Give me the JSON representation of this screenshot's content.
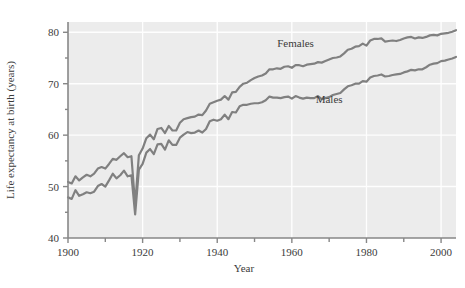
{
  "chart_data": {
    "type": "line",
    "title": "",
    "xlabel": "Year",
    "ylabel": "Life expectancy at birth (years)",
    "xlim": [
      1900,
      2004
    ],
    "ylim": [
      40,
      82
    ],
    "xticks": [
      1900,
      1920,
      1940,
      1960,
      1980,
      2000
    ],
    "xtick_labels": [
      "1900",
      "1920",
      "1940",
      "1960",
      "1980",
      "2000"
    ],
    "xminorticks": [
      1910,
      1930,
      1950,
      1970,
      1990
    ],
    "yticks": [
      40,
      50,
      60,
      70,
      80
    ],
    "ytick_labels": [
      "40",
      "50",
      "60",
      "70",
      "80"
    ],
    "yminorticks": [
      45,
      55,
      65,
      75
    ],
    "grid": true,
    "grid_color": "#ffffff",
    "plot_background": "#ececec",
    "line_color": "#808080",
    "legend_position": "inline-annotations",
    "annotations": [
      {
        "text": "Females",
        "x": 1961,
        "y": 77.2
      },
      {
        "text": "Males",
        "x": 1970,
        "y": 66.2
      }
    ],
    "series": [
      {
        "name": "Females",
        "label": "Females",
        "color": "#808080",
        "x": [
          1900,
          1901,
          1902,
          1903,
          1904,
          1905,
          1906,
          1907,
          1908,
          1909,
          1910,
          1911,
          1912,
          1913,
          1914,
          1915,
          1916,
          1917,
          1918,
          1919,
          1920,
          1921,
          1922,
          1923,
          1924,
          1925,
          1926,
          1927,
          1928,
          1929,
          1930,
          1931,
          1932,
          1933,
          1934,
          1935,
          1936,
          1937,
          1938,
          1939,
          1940,
          1941,
          1942,
          1943,
          1944,
          1945,
          1946,
          1947,
          1948,
          1949,
          1950,
          1951,
          1952,
          1953,
          1954,
          1955,
          1956,
          1957,
          1958,
          1959,
          1960,
          1961,
          1962,
          1963,
          1964,
          1965,
          1966,
          1967,
          1968,
          1969,
          1970,
          1971,
          1972,
          1973,
          1974,
          1975,
          1976,
          1977,
          1978,
          1979,
          1980,
          1981,
          1982,
          1983,
          1984,
          1985,
          1986,
          1987,
          1988,
          1989,
          1990,
          1991,
          1992,
          1993,
          1994,
          1995,
          1996,
          1997,
          1998,
          1999,
          2000,
          2001,
          2002,
          2003,
          2004
        ],
        "y": [
          50.9,
          50.6,
          52.0,
          51.2,
          51.8,
          52.3,
          52.0,
          52.5,
          53.5,
          53.8,
          53.5,
          54.4,
          55.4,
          55.2,
          55.9,
          56.5,
          55.7,
          55.9,
          46.4,
          56.1,
          57.4,
          59.4,
          60.1,
          59.2,
          61.2,
          61.4,
          60.4,
          61.8,
          60.9,
          60.9,
          62.4,
          63.1,
          63.3,
          63.5,
          63.6,
          64.0,
          63.9,
          64.8,
          66.1,
          66.4,
          66.7,
          66.9,
          67.6,
          66.9,
          68.3,
          68.4,
          69.4,
          70.0,
          70.2,
          70.7,
          71.1,
          71.4,
          71.6,
          72.0,
          72.8,
          72.8,
          73.0,
          72.9,
          73.3,
          73.4,
          73.1,
          73.6,
          73.6,
          73.4,
          73.7,
          73.8,
          73.9,
          74.2,
          74.1,
          74.4,
          74.7,
          75.0,
          75.1,
          75.3,
          75.9,
          76.6,
          76.8,
          77.2,
          77.3,
          77.8,
          77.4,
          78.4,
          78.7,
          78.7,
          78.8,
          78.2,
          78.3,
          78.4,
          78.3,
          78.5,
          78.8,
          79.0,
          79.1,
          78.8,
          79.0,
          78.9,
          79.1,
          79.4,
          79.5,
          79.4,
          79.7,
          79.8,
          79.9,
          80.1,
          80.4
        ]
      },
      {
        "name": "Males",
        "label": "Males",
        "color": "#808080",
        "x": [
          1900,
          1901,
          1902,
          1903,
          1904,
          1905,
          1906,
          1907,
          1908,
          1909,
          1910,
          1911,
          1912,
          1913,
          1914,
          1915,
          1916,
          1917,
          1918,
          1919,
          1920,
          1921,
          1922,
          1923,
          1924,
          1925,
          1926,
          1927,
          1928,
          1929,
          1930,
          1931,
          1932,
          1933,
          1934,
          1935,
          1936,
          1937,
          1938,
          1939,
          1940,
          1941,
          1942,
          1943,
          1944,
          1945,
          1946,
          1947,
          1948,
          1949,
          1950,
          1951,
          1952,
          1953,
          1954,
          1955,
          1956,
          1957,
          1958,
          1959,
          1960,
          1961,
          1962,
          1963,
          1964,
          1965,
          1966,
          1967,
          1968,
          1969,
          1970,
          1971,
          1972,
          1973,
          1974,
          1975,
          1976,
          1977,
          1978,
          1979,
          1980,
          1981,
          1982,
          1983,
          1984,
          1985,
          1986,
          1987,
          1988,
          1989,
          1990,
          1991,
          1992,
          1993,
          1994,
          1995,
          1996,
          1997,
          1998,
          1999,
          2000,
          2001,
          2002,
          2003,
          2004
        ],
        "y": [
          47.9,
          47.6,
          49.3,
          48.2,
          48.5,
          48.9,
          48.7,
          49.0,
          50.1,
          50.5,
          50.0,
          51.2,
          52.5,
          51.6,
          52.2,
          53.1,
          52.0,
          52.2,
          44.6,
          53.3,
          54.4,
          56.6,
          57.3,
          56.3,
          58.2,
          58.3,
          57.2,
          59.0,
          58.1,
          58.1,
          59.5,
          60.1,
          60.6,
          60.4,
          60.5,
          60.9,
          60.5,
          61.2,
          62.7,
          63.0,
          62.8,
          63.1,
          64.0,
          63.1,
          64.5,
          64.4,
          65.6,
          65.9,
          65.9,
          66.1,
          66.2,
          66.2,
          66.4,
          66.8,
          67.5,
          67.3,
          67.3,
          67.2,
          67.4,
          67.5,
          67.1,
          67.6,
          67.3,
          67.1,
          67.3,
          67.2,
          67.2,
          67.6,
          67.0,
          67.2,
          67.4,
          67.8,
          68.0,
          68.2,
          68.9,
          69.5,
          69.7,
          70.0,
          70.0,
          70.5,
          70.4,
          71.2,
          71.5,
          71.6,
          71.8,
          71.4,
          71.5,
          71.7,
          71.8,
          71.9,
          72.2,
          72.4,
          72.7,
          72.6,
          72.8,
          72.8,
          73.2,
          73.7,
          73.9,
          74.0,
          74.4,
          74.5,
          74.7,
          74.9,
          75.2
        ]
      }
    ]
  },
  "axis": {
    "ylabel_text": "Life expectancy at birth (years)",
    "xlabel_text": "Year"
  }
}
